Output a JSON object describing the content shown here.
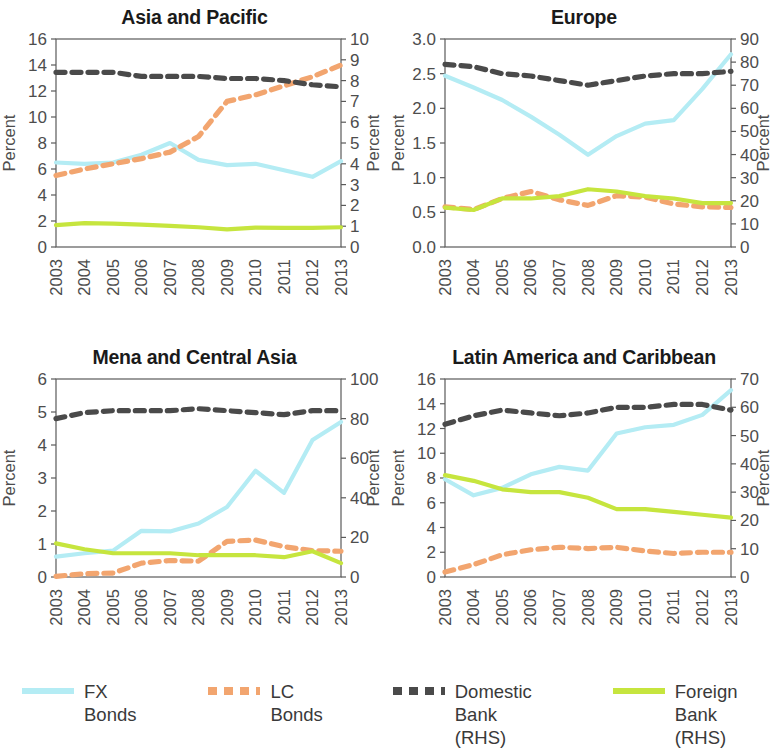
{
  "figure": {
    "background": "#ffffff",
    "axis_color": "#5a5a5a",
    "text_color": "#4d4d4d"
  },
  "legend": {
    "position": "bottom",
    "items": [
      {
        "label": "FX Bonds",
        "color": "#b4ecf4",
        "style": "solid"
      },
      {
        "label": "LC Bonds",
        "color": "#f2a56f",
        "style": "dashed"
      },
      {
        "label": "Domestic Bank\n(RHS)",
        "color": "#4a4a4a",
        "style": "dashed"
      },
      {
        "label": "Foreign Bank\n(RHS)",
        "color": "#c6e53e",
        "style": "solid"
      }
    ]
  },
  "chart_data": [
    {
      "type": "line",
      "title": "Asia and Pacific",
      "xlabel": "",
      "ylabel": "Percent",
      "y2label": "Percent",
      "x": [
        "2003",
        "2004",
        "2005",
        "2006",
        "2007",
        "2008",
        "2009",
        "2010",
        "2011",
        "2012",
        "2013"
      ],
      "ylim": [
        0,
        16
      ],
      "yticks": [
        0,
        2,
        4,
        6,
        8,
        10,
        12,
        14,
        16
      ],
      "y2lim": [
        0,
        10
      ],
      "y2ticks": [
        0,
        1,
        2,
        3,
        4,
        5,
        6,
        7,
        8,
        9,
        10
      ],
      "grid": false,
      "series": [
        {
          "name": "FX Bonds",
          "axis": "left",
          "color": "#b4ecf4",
          "style": "solid",
          "values": [
            6.5,
            6.4,
            6.5,
            7.1,
            8.0,
            6.7,
            6.3,
            6.4,
            5.9,
            5.4,
            6.6
          ]
        },
        {
          "name": "LC Bonds",
          "axis": "left",
          "color": "#f2a56f",
          "style": "dashed",
          "values": [
            5.5,
            6.0,
            6.4,
            6.8,
            7.3,
            8.5,
            11.2,
            11.7,
            12.4,
            13.1,
            14.0
          ]
        },
        {
          "name": "Domestic Bank (RHS)",
          "axis": "right",
          "color": "#4a4a4a",
          "style": "dashed",
          "values": [
            8.4,
            8.4,
            8.4,
            8.2,
            8.2,
            8.2,
            8.1,
            8.1,
            8.0,
            7.8,
            7.7
          ]
        },
        {
          "name": "Foreign Bank (RHS)",
          "axis": "right",
          "color": "#c6e53e",
          "style": "solid",
          "values": [
            1.05,
            1.15,
            1.12,
            1.08,
            1.02,
            0.95,
            0.85,
            0.93,
            0.92,
            0.92,
            0.95
          ]
        }
      ]
    },
    {
      "type": "line",
      "title": "Europe",
      "xlabel": "",
      "ylabel": "Percent",
      "y2label": "Percent",
      "x": [
        "2003",
        "2004",
        "2005",
        "2006",
        "2007",
        "2008",
        "2009",
        "2010",
        "2011",
        "2012",
        "2013"
      ],
      "ylim": [
        0.0,
        3.0
      ],
      "yticks": [
        0.0,
        0.5,
        1.0,
        1.5,
        2.0,
        2.5,
        3.0
      ],
      "y2lim": [
        0,
        90
      ],
      "y2ticks": [
        0,
        10,
        20,
        30,
        40,
        50,
        60,
        70,
        80,
        90
      ],
      "grid": false,
      "series": [
        {
          "name": "FX Bonds",
          "axis": "left",
          "color": "#b4ecf4",
          "style": "solid",
          "values": [
            2.47,
            2.3,
            2.12,
            1.88,
            1.62,
            1.33,
            1.6,
            1.78,
            1.83,
            2.28,
            2.78
          ]
        },
        {
          "name": "LC Bonds",
          "axis": "left",
          "color": "#f2a56f",
          "style": "dashed",
          "values": [
            0.58,
            0.54,
            0.7,
            0.8,
            0.68,
            0.6,
            0.74,
            0.72,
            0.62,
            0.58,
            0.57
          ]
        },
        {
          "name": "Domestic Bank (RHS)",
          "axis": "right",
          "color": "#4a4a4a",
          "style": "dashed",
          "values": [
            79,
            78,
            75,
            74,
            72,
            70,
            72,
            74,
            75,
            75,
            76
          ]
        },
        {
          "name": "Foreign Bank (RHS)",
          "axis": "right",
          "color": "#c6e53e",
          "style": "solid",
          "values": [
            17,
            16,
            21,
            21,
            22,
            25,
            24,
            22,
            21,
            19,
            19
          ]
        }
      ]
    },
    {
      "type": "line",
      "title": "Mena and Central Asia",
      "xlabel": "",
      "ylabel": "Percent",
      "y2label": "Percent",
      "x": [
        "2003",
        "2004",
        "2005",
        "2006",
        "2007",
        "2008",
        "2009",
        "2010",
        "2011",
        "2012",
        "2013"
      ],
      "ylim": [
        0,
        6
      ],
      "yticks": [
        0,
        1,
        2,
        3,
        4,
        5,
        6
      ],
      "y2lim": [
        0,
        100
      ],
      "y2ticks": [
        0,
        20,
        40,
        60,
        80,
        100
      ],
      "grid": false,
      "series": [
        {
          "name": "FX Bonds",
          "axis": "left",
          "color": "#b4ecf4",
          "style": "solid",
          "values": [
            0.62,
            0.72,
            0.8,
            1.4,
            1.38,
            1.62,
            2.12,
            3.22,
            2.55,
            4.15,
            4.7
          ]
        },
        {
          "name": "LC Bonds",
          "axis": "left",
          "color": "#f2a56f",
          "style": "dashed",
          "values": [
            0.02,
            0.1,
            0.12,
            0.42,
            0.5,
            0.48,
            1.08,
            1.12,
            0.92,
            0.8,
            0.78
          ]
        },
        {
          "name": "Domestic Bank (RHS)",
          "axis": "right",
          "color": "#4a4a4a",
          "style": "dashed",
          "values": [
            80,
            83,
            84,
            84,
            84,
            85,
            84,
            83,
            82,
            84,
            84
          ]
        },
        {
          "name": "Foreign Bank (RHS)",
          "axis": "right",
          "color": "#c6e53e",
          "style": "solid",
          "values": [
            17,
            14,
            12,
            12,
            12,
            11,
            11,
            11,
            10,
            13,
            7
          ]
        }
      ]
    },
    {
      "type": "line",
      "title": "Latin America and Caribbean",
      "xlabel": "",
      "ylabel": "Percent",
      "y2label": "Percent",
      "x": [
        "2003",
        "2004",
        "2005",
        "2006",
        "2007",
        "2008",
        "2009",
        "2010",
        "2011",
        "2012",
        "2013"
      ],
      "ylim": [
        0,
        16
      ],
      "yticks": [
        0,
        2,
        4,
        6,
        8,
        10,
        12,
        14,
        16
      ],
      "y2lim": [
        0,
        70
      ],
      "y2ticks": [
        0,
        10,
        20,
        30,
        40,
        50,
        60,
        70
      ],
      "grid": false,
      "series": [
        {
          "name": "FX Bonds",
          "axis": "left",
          "color": "#b4ecf4",
          "style": "solid",
          "values": [
            7.9,
            6.6,
            7.2,
            8.3,
            8.9,
            8.6,
            11.6,
            12.1,
            12.3,
            13.1,
            15.1
          ]
        },
        {
          "name": "LC Bonds",
          "axis": "left",
          "color": "#f2a56f",
          "style": "dashed",
          "values": [
            0.4,
            1.0,
            1.8,
            2.2,
            2.4,
            2.3,
            2.4,
            2.1,
            1.9,
            2.0,
            2.0
          ]
        },
        {
          "name": "Domestic Bank (RHS)",
          "axis": "right",
          "color": "#4a4a4a",
          "style": "dashed",
          "values": [
            54,
            57,
            59,
            58,
            57,
            58,
            60,
            60,
            61,
            61,
            59
          ]
        },
        {
          "name": "Foreign Bank (RHS)",
          "axis": "right",
          "color": "#c6e53e",
          "style": "solid",
          "values": [
            36,
            34,
            31,
            30,
            30,
            28,
            24,
            24,
            23,
            22,
            21
          ]
        }
      ]
    }
  ]
}
